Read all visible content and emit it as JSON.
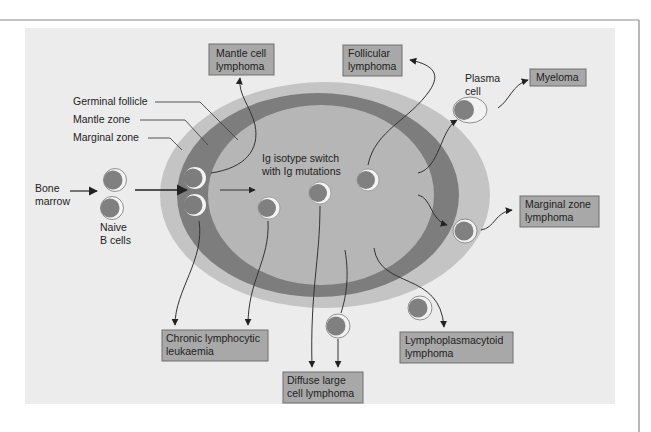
{
  "colors": {
    "panel_bg": "#ececec",
    "marginal_zone": "#c4c4c4",
    "mantle_zone": "#7d7d7d",
    "germinal_follicle": "#b6b6b6",
    "box_fill": "#a8a8a8",
    "cell_nucleus": "#808080",
    "cell_membrane": "#f4f4f4"
  },
  "zone_labels": {
    "germinal_follicle": "Germinal follicle",
    "mantle_zone": "Mantle zone",
    "marginal_zone": "Marginal zone"
  },
  "source": {
    "line1": "Bone",
    "line2": "marrow"
  },
  "naive_cells": {
    "line1": "Naive",
    "line2": "B cells"
  },
  "center_label": {
    "line1": "Ig isotype switch",
    "line2": "with Ig mutations"
  },
  "plasma_cell": {
    "line1": "Plasma",
    "line2": "cell"
  },
  "boxes": {
    "mantle_cell_lymphoma": {
      "line1": "Mantle cell",
      "line2": "lymphoma"
    },
    "follicular_lymphoma": {
      "line1": "Follicular",
      "line2": "lymphoma"
    },
    "myeloma": {
      "line1": "Myeloma"
    },
    "marginal_zone_lymphoma": {
      "line1": "Marginal zone",
      "line2": "lymphoma"
    },
    "chronic_lymphocytic_leukaemia": {
      "line1": "Chronic lymphocytic",
      "line2": "leukaemia"
    },
    "diffuse_large_cell_lymphoma": {
      "line1": "Diffuse large",
      "line2": "cell lymphoma"
    },
    "lymphoplasmacytoid_lymphoma": {
      "line1": "Lymphoplasmacytoid",
      "line2": "lymphoma"
    }
  }
}
